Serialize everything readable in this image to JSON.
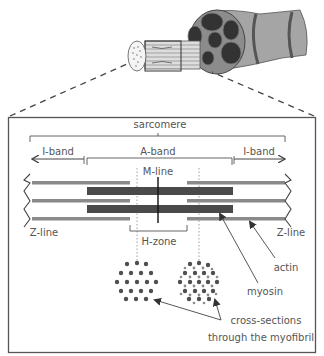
{
  "diagram": {
    "labels": {
      "sarcomere": "sarcomere",
      "i_band_left": "I-band",
      "a_band": "A-band",
      "i_band_right": "I-band",
      "m_line": "M-line",
      "z_line_left": "Z-line",
      "z_line_right": "Z-line",
      "h_zone": "H-zone",
      "actin": "actin",
      "myosin": "myosin",
      "cross_sections_line1": "cross-sections",
      "cross_sections_line2": "through the myofibril"
    },
    "colors": {
      "thick_filament": "#4a4a4a",
      "thin_filament": "#8a8a8a",
      "box_border": "#555555",
      "text": "#555555",
      "muscle_fill": "#9a9a9a",
      "muscle_dark": "#3a3a3a"
    },
    "illustration": {
      "description": "muscle fibre bundle with myofibril zoomed out",
      "components": [
        "muscle",
        "fascicles",
        "muscle-fibre",
        "myofibril"
      ]
    }
  }
}
